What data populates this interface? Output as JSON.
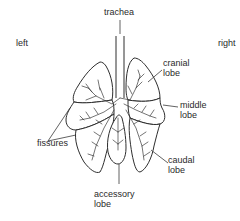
{
  "diagram": {
    "labels": {
      "trachea": "trachea",
      "left": "left",
      "right": "right",
      "cranial": [
        "cranial",
        "lobe"
      ],
      "middle": [
        "middle",
        "lobe"
      ],
      "caudal": [
        "caudal",
        "lobe"
      ],
      "accessory": [
        "accessory",
        "lobe"
      ],
      "fissures": "fissures"
    },
    "colors": {
      "line": "#2e2e2e",
      "text": "#2a2a2a",
      "background": "#ffffff"
    }
  }
}
